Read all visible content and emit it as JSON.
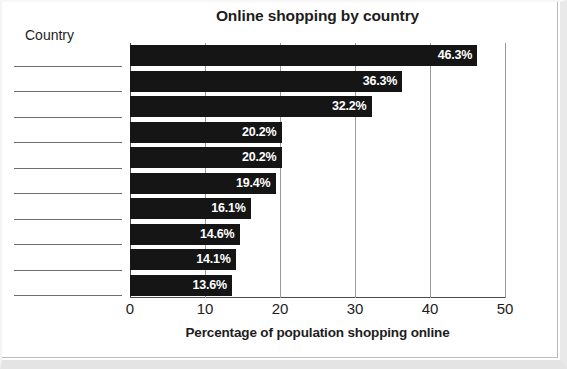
{
  "page": {
    "country_header": "Country",
    "answer_line_count": 10
  },
  "chart_data": {
    "type": "bar",
    "orientation": "horizontal",
    "title": "Online shopping by country",
    "xlabel": "Percentage of population shopping online",
    "ylabel": "Country",
    "xlim": [
      0,
      50
    ],
    "xticks": [
      0,
      10,
      20,
      30,
      40,
      50
    ],
    "xtick_labels": [
      "0",
      "10",
      "20",
      "30",
      "40",
      "50"
    ],
    "grid": "vertical",
    "legend": "none",
    "categories": [
      "",
      "",
      "",
      "",
      "",
      "",
      "",
      "",
      "",
      ""
    ],
    "values": [
      46.3,
      36.3,
      32.2,
      20.2,
      20.2,
      19.4,
      16.1,
      14.6,
      14.1,
      13.6
    ],
    "data_labels": [
      "46.3%",
      "36.3%",
      "32.2%",
      "20.2%",
      "20.2%",
      "19.4%",
      "16.1%",
      "14.6%",
      "14.1%",
      "13.6%"
    ],
    "bar_color": "#151515",
    "data_label_color": "#ffffff",
    "axis_color": "#4a4a4a",
    "grid_color": "#9a9a9a"
  }
}
